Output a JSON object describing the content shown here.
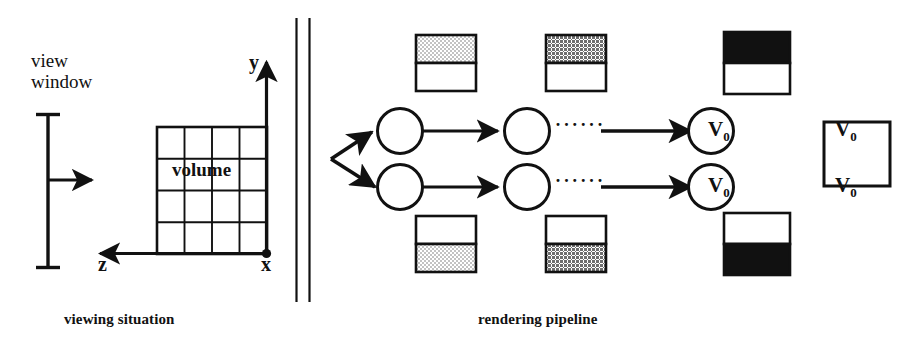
{
  "figure": {
    "background_color": "#ffffff",
    "ink_color": "#111111"
  },
  "left_panel": {
    "caption": "viewing situation",
    "view_window": {
      "label_line1": "view",
      "label_line2": "window",
      "ray_arrow_name": "viewing-ray-arrow"
    },
    "volume": {
      "label": "volume",
      "grid_columns": 4,
      "grid_rows": 4
    },
    "axes": {
      "y_label": "y",
      "z_label": "z",
      "x_label": "x",
      "origin_dot": "●"
    }
  },
  "divider": {
    "name": "panel-divider",
    "line_count": 2
  },
  "right_panel": {
    "caption": "rendering pipeline",
    "node_label_base": "V",
    "node_label_sub": "0",
    "ellipsis": "······",
    "rows": [
      {
        "name": "pipeline-row-top",
        "stages": [
          {
            "name": "stage-1",
            "node": "V0",
            "tile_fill": "light-stipple",
            "tile_filled_half": "top"
          },
          {
            "name": "stage-2",
            "node": "V0",
            "tile_fill": "dark-stipple",
            "tile_filled_half": "top"
          },
          {
            "name": "stage-3",
            "node": "V0",
            "tile_fill": "solid-black",
            "tile_filled_half": "top"
          }
        ]
      },
      {
        "name": "pipeline-row-bottom",
        "stages": [
          {
            "name": "stage-1",
            "node": "V0",
            "tile_fill": "light-stipple",
            "tile_filled_half": "bottom"
          },
          {
            "name": "stage-2",
            "node": "V0",
            "tile_fill": "dark-stipple",
            "tile_filled_half": "bottom"
          },
          {
            "name": "stage-3",
            "node": "V0",
            "tile_fill": "solid-black",
            "tile_filled_half": "bottom"
          }
        ]
      }
    ],
    "output_tile": {
      "name": "output-image-tile",
      "fill": "white"
    },
    "colors": {
      "light_stipple": "#cfcfcf",
      "dark_stipple": "#8a8a8a",
      "solid_black": "#111111",
      "white": "#ffffff"
    }
  }
}
